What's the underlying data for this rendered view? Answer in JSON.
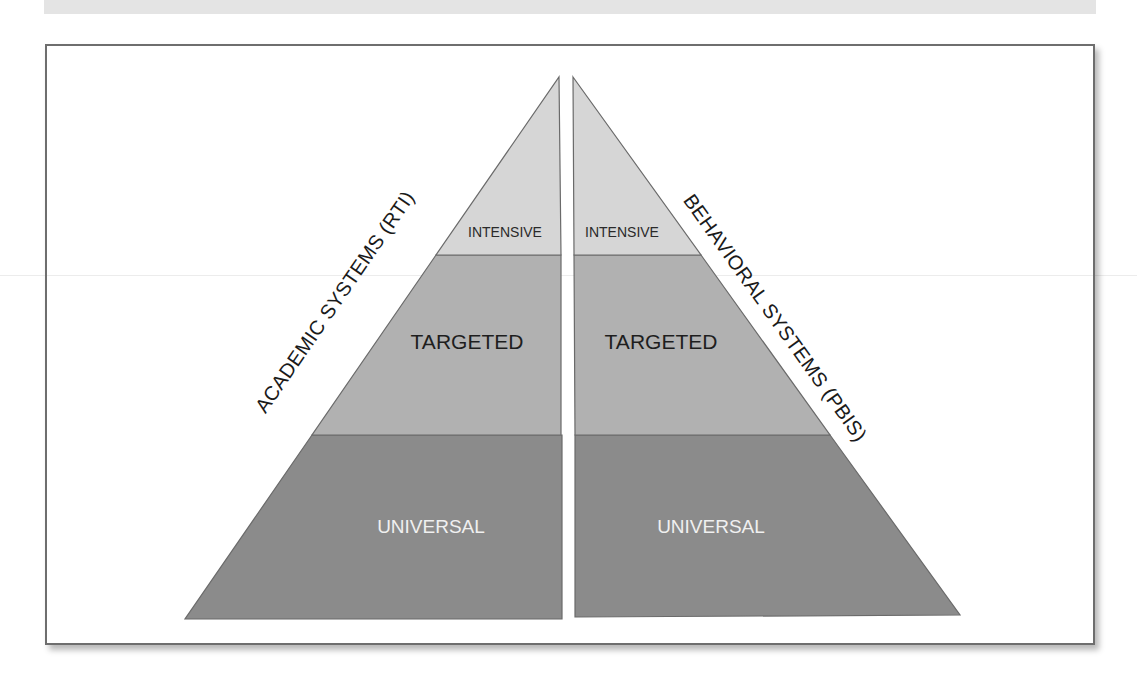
{
  "figure": {
    "type": "dual-pyramid",
    "left_pyramid": {
      "title": "ACADEMIC SYSTEMS (RTI)",
      "tiers": [
        {
          "name": "intensive",
          "label": "INTENSIVE",
          "color": "#d6d6d6"
        },
        {
          "name": "targeted",
          "label": "TARGETED",
          "color": "#b1b1b1"
        },
        {
          "name": "universal",
          "label": "UNIVERSAL",
          "color": "#8b8b8b"
        }
      ]
    },
    "right_pyramid": {
      "title": "BEHAVIORAL SYSTEMS (PBIS)",
      "tiers": [
        {
          "name": "intensive",
          "label": "INTENSIVE",
          "color": "#d6d6d6"
        },
        {
          "name": "targeted",
          "label": "TARGETED",
          "color": "#b1b1b1"
        },
        {
          "name": "universal",
          "label": "UNIVERSAL",
          "color": "#8b8b8b"
        }
      ]
    },
    "colors": {
      "outline": "#6a6a6a",
      "frame": "#6e6e6e"
    }
  }
}
